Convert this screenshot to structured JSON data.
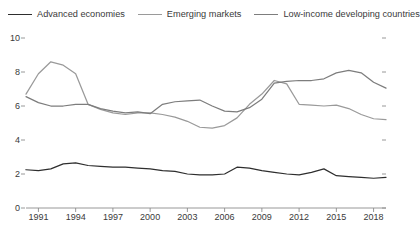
{
  "legend": {
    "position": "top-left",
    "items": [
      {
        "label": "Advanced economies",
        "color": "#2e2e2e",
        "icon": "line-swatch-icon"
      },
      {
        "label": "Emerging markets",
        "color": "#9a9a9a",
        "icon": "line-swatch-icon"
      },
      {
        "label": "Low-income developing countries",
        "color": "#7d7d7d",
        "icon": "line-swatch-icon"
      }
    ]
  },
  "axes": {
    "y_ticks": [
      "0",
      "2",
      "4",
      "6",
      "8",
      "10"
    ],
    "x_ticks": [
      "1991",
      "1994",
      "1997",
      "2000",
      "2003",
      "2006",
      "2009",
      "2012",
      "2015",
      "2018"
    ]
  },
  "chart_data": {
    "type": "line",
    "title": "",
    "subtitle": "",
    "xlabel": "",
    "ylabel": "",
    "xlim": [
      1990,
      2019
    ],
    "ylim": [
      0,
      10
    ],
    "grid": false,
    "legend_position": "top-left",
    "x": [
      1990,
      1991,
      1992,
      1993,
      1994,
      1995,
      1996,
      1997,
      1998,
      1999,
      2000,
      2001,
      2002,
      2003,
      2004,
      2005,
      2006,
      2007,
      2008,
      2009,
      2010,
      2011,
      2012,
      2013,
      2014,
      2015,
      2016,
      2017,
      2018,
      2019
    ],
    "series": [
      {
        "name": "Advanced economies",
        "color": "#2e2e2e",
        "values": [
          2.25,
          2.2,
          2.3,
          2.6,
          2.65,
          2.5,
          2.45,
          2.4,
          2.4,
          2.35,
          2.3,
          2.2,
          2.15,
          2.0,
          1.95,
          1.95,
          2.0,
          2.4,
          2.35,
          2.2,
          2.1,
          2.0,
          1.95,
          2.1,
          2.3,
          1.9,
          1.85,
          1.8,
          1.75,
          1.8
        ]
      },
      {
        "name": "Emerging markets",
        "color": "#9a9a9a",
        "values": [
          6.7,
          7.9,
          8.6,
          8.4,
          7.9,
          6.1,
          5.8,
          5.6,
          5.5,
          5.6,
          5.6,
          5.5,
          5.35,
          5.1,
          4.75,
          4.7,
          4.85,
          5.3,
          6.1,
          6.7,
          7.5,
          7.3,
          6.1,
          6.05,
          6.0,
          6.05,
          5.85,
          5.5,
          5.25,
          5.2
        ]
      },
      {
        "name": "Low-income developing countries",
        "color": "#7d7d7d",
        "values": [
          6.55,
          6.2,
          6.0,
          6.0,
          6.1,
          6.1,
          5.85,
          5.7,
          5.6,
          5.65,
          5.55,
          6.1,
          6.25,
          6.3,
          6.35,
          6.0,
          5.7,
          5.65,
          5.9,
          6.4,
          7.35,
          7.45,
          7.5,
          7.5,
          7.6,
          7.95,
          8.1,
          7.95,
          7.4,
          7.05
        ]
      }
    ]
  }
}
